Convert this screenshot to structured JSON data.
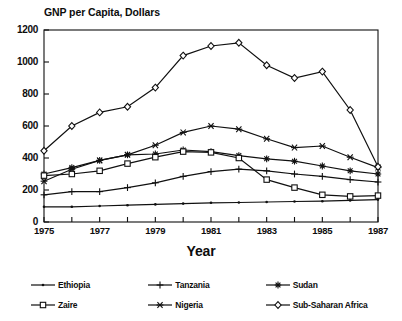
{
  "chart_data": {
    "type": "line",
    "title": "GNP per Capita, Dollars",
    "xlabel": "Year",
    "ylabel": "",
    "xlim": [
      1975,
      1987
    ],
    "ylim": [
      0,
      1200
    ],
    "yticks": [
      0,
      200,
      400,
      600,
      800,
      1000,
      1200
    ],
    "xticks": [
      1975,
      1976,
      1977,
      1978,
      1979,
      1980,
      1981,
      1982,
      1983,
      1984,
      1985,
      1986,
      1987
    ],
    "xticklabels": [
      "1975",
      "",
      "1977",
      "",
      "1979",
      "",
      "1981",
      "",
      "1983",
      "",
      "1985",
      "",
      "1987"
    ],
    "grid": false,
    "legend_position": "bottom",
    "x": [
      1975,
      1976,
      1977,
      1978,
      1979,
      1980,
      1981,
      1982,
      1983,
      1984,
      1985,
      1986,
      1987
    ],
    "series": [
      {
        "name": "Ethiopia",
        "marker": "dot",
        "values": [
          95,
          95,
          100,
          105,
          110,
          115,
          120,
          122,
          125,
          128,
          130,
          135,
          140
        ]
      },
      {
        "name": "Tanzania",
        "marker": "plus",
        "values": [
          170,
          190,
          190,
          215,
          245,
          285,
          315,
          330,
          320,
          300,
          285,
          265,
          250
        ]
      },
      {
        "name": "Sudan",
        "marker": "star",
        "values": [
          300,
          340,
          385,
          420,
          425,
          450,
          440,
          415,
          395,
          380,
          350,
          320,
          300
        ]
      },
      {
        "name": "Zaire",
        "marker": "square",
        "values": [
          290,
          300,
          320,
          365,
          405,
          440,
          435,
          400,
          265,
          215,
          170,
          160,
          165
        ]
      },
      {
        "name": "Nigeria",
        "marker": "asterisk",
        "values": [
          255,
          330,
          385,
          420,
          480,
          560,
          600,
          580,
          520,
          465,
          475,
          405,
          340
        ]
      },
      {
        "name": "Sub-Saharan Africa",
        "marker": "diamond",
        "values": [
          445,
          600,
          685,
          720,
          840,
          1040,
          1100,
          1120,
          980,
          900,
          940,
          700,
          345
        ]
      }
    ]
  }
}
